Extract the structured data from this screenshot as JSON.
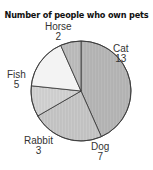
{
  "chart_data": {
    "type": "pie",
    "title": "Number of people who own pets",
    "categories": [
      "Cat",
      "Dog",
      "Rabbit",
      "Fish",
      "Horse"
    ],
    "values": [
      13,
      7,
      3,
      5,
      2
    ],
    "total": 30,
    "start_angle_deg": 0,
    "direction": "clockwise",
    "colors": [
      "#b5b5b5",
      "#c6c6c6",
      "#d2d2d2",
      "#f3f3f3",
      "#bdbdbd"
    ],
    "labels_outside": true,
    "legend": null
  },
  "labels": {
    "cat": {
      "name": "Cat",
      "value": "13"
    },
    "dog": {
      "name": "Dog",
      "value": "7"
    },
    "rabbit": {
      "name": "Rabbit",
      "value": "3"
    },
    "fish": {
      "name": "Fish",
      "value": "5"
    },
    "horse": {
      "name": "Horse",
      "value": "2"
    }
  }
}
